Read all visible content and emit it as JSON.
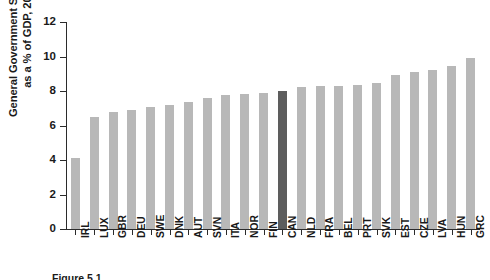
{
  "chart_data": {
    "type": "bar",
    "title": "",
    "xlabel": "",
    "ylabel": "General Government Spending as a % of GDP, 2016",
    "ylabel_line1": "General Government Spending",
    "ylabel_line2": "as a % of GDP, 2016",
    "ylim": [
      0,
      12
    ],
    "yticks": [
      0,
      2,
      4,
      6,
      8,
      10,
      12
    ],
    "ytick_labels": [
      "0",
      "2",
      "4",
      "6",
      "8",
      "10",
      "12"
    ],
    "grid": false,
    "legend": "none",
    "highlight_category": "CAN",
    "categories": [
      "IRL",
      "LUX",
      "GBR",
      "DEU",
      "SWE",
      "DNK",
      "AUT",
      "SVN",
      "ITA",
      "NOR",
      "FIN",
      "CAN",
      "NLD",
      "FRA",
      "BEL",
      "PRT",
      "SVK",
      "EST",
      "CZE",
      "LVA",
      "HUN",
      "GRC"
    ],
    "values": [
      4.1,
      6.5,
      6.8,
      6.9,
      7.1,
      7.2,
      7.35,
      7.6,
      7.75,
      7.85,
      7.9,
      8.0,
      8.25,
      8.3,
      8.3,
      8.35,
      8.45,
      8.9,
      9.1,
      9.2,
      9.45,
      9.9
    ],
    "series": [
      {
        "name": "General Government Spending (% of GDP, 2016)",
        "values": [
          4.1,
          6.5,
          6.8,
          6.9,
          7.1,
          7.2,
          7.35,
          7.6,
          7.75,
          7.85,
          7.9,
          8.0,
          8.25,
          8.3,
          8.3,
          8.35,
          8.45,
          8.9,
          9.1,
          9.2,
          9.45,
          9.9
        ]
      }
    ]
  },
  "colors": {
    "bar": "#b8b8b8",
    "bar_highlight": "#5d5d5d",
    "axis": "#2b2b2b",
    "text": "#1a1a1a",
    "background": "#ffffff"
  },
  "caption": {
    "text": "Figure 5.1"
  }
}
